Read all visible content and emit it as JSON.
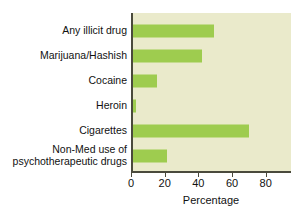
{
  "chart_data": {
    "type": "bar",
    "orientation": "horizontal",
    "title": "",
    "subtitle": "",
    "xlabel": "Percentage",
    "ylabel": "",
    "categories": [
      "Any illicit drug",
      "Marijuana/Hashish",
      "Cocaine",
      "Heroin",
      "Cigarettes",
      "Non-Med use of\npsychotherapeutic drugs"
    ],
    "values": [
      48,
      41,
      14,
      2,
      69,
      20
    ],
    "xlim": [
      0,
      95
    ],
    "xticks": [
      0,
      20,
      40,
      60,
      80
    ],
    "xticklabels": [
      "0",
      "20",
      "40",
      "60",
      "80"
    ],
    "grid": false,
    "legend": null,
    "bar_color": "#9ecc4f",
    "panel_color": "#eaeacb",
    "axis_color": "#4a4a3c",
    "text_color": "#111111"
  },
  "axis": {
    "xlabel": "Percentage"
  }
}
